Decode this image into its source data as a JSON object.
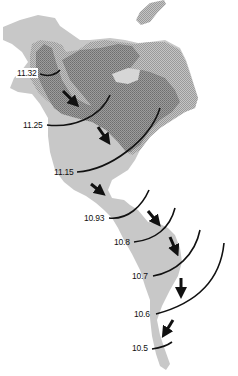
{
  "map": {
    "subject": "Americas",
    "colors": {
      "land_light": "#c9c9c9",
      "land_dark": "#8f8f8f",
      "land_stipple": "#a9a9a9",
      "contour": "#111111",
      "arrow": "#111111",
      "background": "#ffffff"
    },
    "contours": [
      {
        "label": "11.32"
      },
      {
        "label": "11.25"
      },
      {
        "label": "11.15"
      },
      {
        "label": "10.93"
      },
      {
        "label": "10.8"
      },
      {
        "label": "10.7"
      },
      {
        "label": "10.6"
      },
      {
        "label": "10.5"
      }
    ],
    "arrows": {
      "count": 7,
      "direction": "southward"
    }
  }
}
